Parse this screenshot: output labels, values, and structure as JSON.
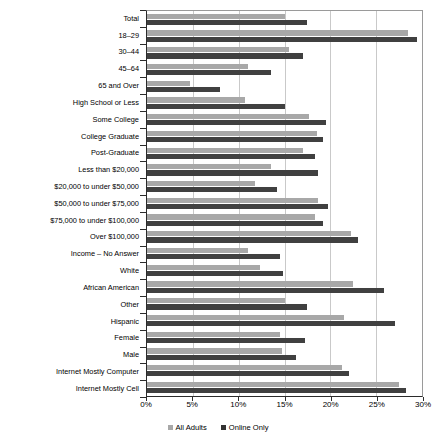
{
  "chart_data": {
    "type": "bar",
    "orientation": "horizontal",
    "title": "",
    "subtitle": "",
    "xlabel": "",
    "ylabel": "",
    "xlim": [
      0,
      30
    ],
    "xticks": [
      0,
      5,
      10,
      15,
      20,
      25,
      30
    ],
    "xtick_labels": [
      "0%",
      "5%",
      "10%",
      "15%",
      "20%",
      "25%",
      "30%"
    ],
    "grid": true,
    "grid_axis": "x",
    "legend_position": "bottom-center",
    "categories": [
      "Total",
      "18–29",
      "30–44",
      "45–64",
      "65 and Over",
      "High School or Less",
      "Some College",
      "College Graduate",
      "Post-Graduate",
      "Less than $20,000",
      "$20,000 to under $50,000",
      "$50,000 to under $75,000",
      "$75,000 to under $100,000",
      "Over $100,000",
      "Income – No Answer",
      "White",
      "African American",
      "Other",
      "Hispanic",
      "Female",
      "Male",
      "Internet Mostly Computer",
      "Internet Mostly Cell"
    ],
    "series": [
      {
        "name": "All Adults",
        "color": "#a8a8a8",
        "values": [
          15.0,
          28.5,
          15.5,
          11.0,
          4.7,
          10.7,
          17.7,
          18.5,
          17.0,
          13.5,
          11.8,
          18.7,
          18.3,
          22.3,
          11.0,
          12.3,
          22.5,
          15.0,
          21.5,
          14.5,
          14.7,
          21.3,
          27.5
        ]
      },
      {
        "name": "Online Only",
        "color": "#404040",
        "values": [
          17.5,
          29.5,
          17.0,
          13.5,
          8.0,
          15.0,
          19.5,
          19.2,
          18.3,
          18.7,
          14.2,
          19.7,
          19.2,
          23.0,
          14.5,
          14.8,
          25.8,
          17.5,
          27.0,
          17.2,
          16.2,
          22.0,
          28.3
        ]
      }
    ]
  },
  "legend": {
    "items": [
      {
        "label": "All Adults",
        "swatch": "all-adults"
      },
      {
        "label": "Online Only",
        "swatch": "online-only"
      }
    ]
  }
}
